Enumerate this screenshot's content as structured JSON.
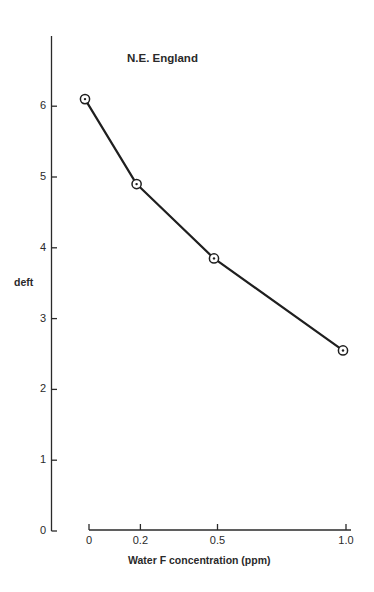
{
  "chart_data": {
    "type": "line",
    "title": "N.E. England",
    "xlabel": "Water F concentration (ppm)",
    "ylabel": "deft",
    "x": [
      0,
      0.2,
      0.5,
      1.0
    ],
    "series": [
      {
        "name": "N.E. England",
        "values": [
          6.1,
          4.9,
          3.85,
          2.55
        ],
        "marker": "circled-dot"
      }
    ],
    "xticks": [
      "0",
      "0.2",
      "0.5",
      "1.0"
    ],
    "yticks": [
      "0",
      "1",
      "2",
      "3",
      "4",
      "5",
      "6"
    ],
    "xlim": [
      0,
      1.0
    ],
    "ylim": [
      0,
      6.9
    ],
    "grid": false,
    "legend": "none"
  },
  "colors": {
    "line": "#1f1f1f",
    "text": "#2a2a2a",
    "background": "#ffffff"
  }
}
